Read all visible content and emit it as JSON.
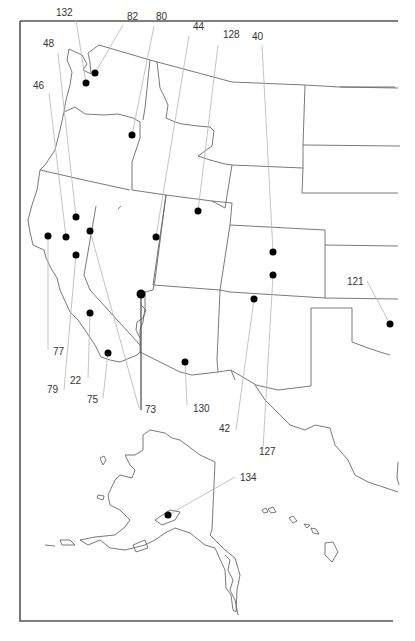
{
  "map": {
    "title": "",
    "region": "Western United States, Alaska and Hawaii",
    "colors": {
      "border": "#6a6a6a",
      "leader": "#b5b5b5",
      "dot": "#000000",
      "frame": "#555555",
      "label": "#333333"
    },
    "sites": [
      {
        "id": "132",
        "label": "132",
        "dot": [
          86,
          83
        ],
        "label_pos": [
          56,
          16
        ],
        "leader_from": [
          76,
          20
        ]
      },
      {
        "id": "82",
        "label": "82",
        "dot": [
          95,
          73
        ],
        "label_pos": [
          127,
          20
        ],
        "leader_from": [
          123,
          25
        ]
      },
      {
        "id": "80",
        "label": "80",
        "dot": [
          132,
          135
        ],
        "label_pos": [
          156,
          20
        ],
        "leader_from": [
          154,
          26
        ]
      },
      {
        "id": "44",
        "label": "44",
        "dot": [
          156,
          237
        ],
        "label_pos": [
          193,
          30
        ],
        "leader_from": [
          189,
          36
        ]
      },
      {
        "id": "128",
        "label": "128",
        "dot": [
          198,
          211
        ],
        "label_pos": [
          223,
          38
        ],
        "leader_from": [
          218,
          45
        ]
      },
      {
        "id": "40",
        "label": "40",
        "dot": [
          273,
          252
        ],
        "label_pos": [
          252,
          40
        ],
        "leader_from": [
          262,
          45
        ]
      },
      {
        "id": "48",
        "label": "48",
        "dot": [
          76,
          217
        ],
        "label_pos": [
          43,
          47
        ],
        "leader_from": [
          58,
          53
        ]
      },
      {
        "id": "46",
        "label": "46",
        "dot": [
          66,
          237
        ],
        "label_pos": [
          33,
          89
        ],
        "leader_from": [
          49,
          93
        ]
      },
      {
        "id": "77",
        "label": "77",
        "dot": [
          48,
          236
        ],
        "label_pos": [
          53,
          355
        ],
        "leader_from": [
          48,
          350
        ]
      },
      {
        "id": "79",
        "label": "79",
        "dot": [
          76,
          255
        ],
        "label_pos": [
          47,
          393
        ],
        "leader_from": [
          64,
          390
        ]
      },
      {
        "id": "22",
        "label": "22",
        "dot": [
          90,
          313
        ],
        "label_pos": [
          70,
          384
        ],
        "leader_from": [
          88,
          378
        ]
      },
      {
        "id": "75",
        "label": "75",
        "dot": [
          108,
          353
        ],
        "label_pos": [
          87,
          403
        ],
        "leader_from": [
          103,
          398
        ]
      },
      {
        "id": "73",
        "label": "73",
        "dot": [
          90,
          231
        ],
        "label_pos": [
          145,
          413
        ],
        "leader_from": [
          139,
          408
        ]
      },
      {
        "id": "73b",
        "label": "",
        "dot": [
          141,
          294
        ],
        "label_pos": [
          0,
          0
        ],
        "leader_from": [
          141,
          410
        ],
        "large": true
      },
      {
        "id": "130",
        "label": "130",
        "dot": [
          185,
          362
        ],
        "label_pos": [
          193,
          412
        ],
        "leader_from": [
          187,
          405
        ]
      },
      {
        "id": "42",
        "label": "42",
        "dot": [
          254,
          299
        ],
        "label_pos": [
          219,
          432
        ],
        "leader_from": [
          236,
          430
        ]
      },
      {
        "id": "127",
        "label": "127",
        "dot": [
          273,
          275
        ],
        "label_pos": [
          259,
          455
        ],
        "leader_from": [
          263,
          449
        ]
      },
      {
        "id": "121",
        "label": "121",
        "dot": [
          390,
          324
        ],
        "label_pos": [
          347,
          285
        ],
        "leader_from": [
          367,
          281
        ]
      },
      {
        "id": "134",
        "label": "134",
        "dot": [
          168,
          515
        ],
        "label_pos": [
          240,
          481
        ],
        "leader_from": [
          235,
          477
        ]
      }
    ]
  }
}
